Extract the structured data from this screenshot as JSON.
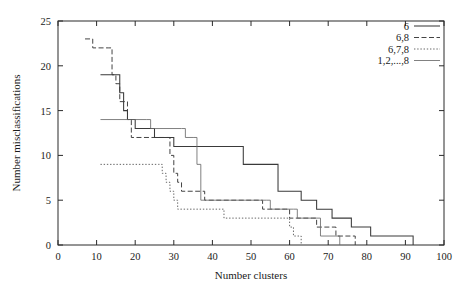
{
  "chart_data": {
    "type": "line",
    "title": "",
    "xlabel": "Number clusters",
    "ylabel": "Number misclassifications",
    "xlim": [
      0,
      100
    ],
    "ylim": [
      0,
      25
    ],
    "xticks": [
      0,
      10,
      20,
      30,
      40,
      50,
      60,
      70,
      80,
      90,
      100
    ],
    "yticks": [
      0,
      5,
      10,
      15,
      20,
      25
    ],
    "grid": false,
    "legend_position": "top-right",
    "step_style": "post",
    "series": [
      {
        "name": "6",
        "style": "solid",
        "color": "#3a3a3a",
        "points": [
          [
            11,
            19
          ],
          [
            15,
            19
          ],
          [
            16,
            17
          ],
          [
            17,
            15
          ],
          [
            18,
            14
          ],
          [
            19,
            14
          ],
          [
            20,
            13
          ],
          [
            24,
            13
          ],
          [
            25,
            12
          ],
          [
            29,
            12
          ],
          [
            30,
            11
          ],
          [
            32,
            11
          ],
          [
            33,
            11
          ],
          [
            47,
            11
          ],
          [
            48,
            9
          ],
          [
            53,
            9
          ],
          [
            56,
            9
          ],
          [
            57,
            6
          ],
          [
            62,
            6
          ],
          [
            63,
            5
          ],
          [
            66,
            5
          ],
          [
            67,
            4
          ],
          [
            70,
            4
          ],
          [
            71,
            3
          ],
          [
            75,
            3
          ],
          [
            76,
            2
          ],
          [
            80,
            2
          ],
          [
            81,
            1
          ],
          [
            91,
            1
          ],
          [
            92,
            0
          ]
        ]
      },
      {
        "name": "6,8",
        "style": "dashed",
        "color": "#3a3a3a",
        "points": [
          [
            7,
            23
          ],
          [
            9,
            22
          ],
          [
            13,
            22
          ],
          [
            14,
            19
          ],
          [
            15,
            18
          ],
          [
            16,
            16
          ],
          [
            17,
            16
          ],
          [
            18,
            14
          ],
          [
            19,
            12
          ],
          [
            28,
            12
          ],
          [
            29,
            10
          ],
          [
            30,
            8
          ],
          [
            31,
            7
          ],
          [
            32,
            6
          ],
          [
            37,
            6
          ],
          [
            38,
            5
          ],
          [
            52,
            5
          ],
          [
            53,
            4
          ],
          [
            59,
            4
          ],
          [
            60,
            3
          ],
          [
            66,
            3
          ],
          [
            67,
            2
          ],
          [
            71,
            2
          ],
          [
            72,
            1
          ],
          [
            76,
            1
          ],
          [
            77,
            0
          ]
        ]
      },
      {
        "name": "6,7,8",
        "style": "dotted",
        "color": "#555555",
        "points": [
          [
            11,
            9
          ],
          [
            26,
            9
          ],
          [
            27,
            8
          ],
          [
            28,
            7
          ],
          [
            29,
            6
          ],
          [
            30,
            5
          ],
          [
            31,
            4
          ],
          [
            42,
            4
          ],
          [
            43,
            3
          ],
          [
            59,
            3
          ],
          [
            60,
            2
          ],
          [
            61,
            1
          ],
          [
            62,
            1
          ],
          [
            63,
            0
          ]
        ]
      },
      {
        "name": "1,2,...,8",
        "style": "thin-solid",
        "color": "#6a6a6a",
        "points": [
          [
            11,
            14
          ],
          [
            19,
            14
          ],
          [
            20,
            14
          ],
          [
            23,
            14
          ],
          [
            24,
            13
          ],
          [
            32,
            13
          ],
          [
            33,
            12
          ],
          [
            35,
            12
          ],
          [
            36,
            9
          ],
          [
            37,
            5
          ],
          [
            40,
            5
          ],
          [
            41,
            5
          ],
          [
            54,
            5
          ],
          [
            55,
            4
          ],
          [
            61,
            4
          ],
          [
            62,
            3
          ],
          [
            67,
            3
          ],
          [
            68,
            1
          ],
          [
            72,
            1
          ],
          [
            73,
            0
          ]
        ]
      }
    ]
  },
  "legend": {
    "entries": [
      {
        "label": "6"
      },
      {
        "label": "6,8"
      },
      {
        "label": "6,7,8"
      },
      {
        "label": "1,2,...,8"
      }
    ]
  },
  "axes": {
    "x_title": "Number clusters",
    "y_title": "Number misclassifications",
    "x_tick_labels": [
      "0",
      "10",
      "20",
      "30",
      "40",
      "50",
      "60",
      "70",
      "80",
      "90",
      "100"
    ],
    "y_tick_labels": [
      "0",
      "5",
      "10",
      "15",
      "20",
      "25"
    ]
  },
  "colors": {
    "frame": "#2a2a2a",
    "text": "#1a1a1a",
    "background": "#ffffff"
  }
}
